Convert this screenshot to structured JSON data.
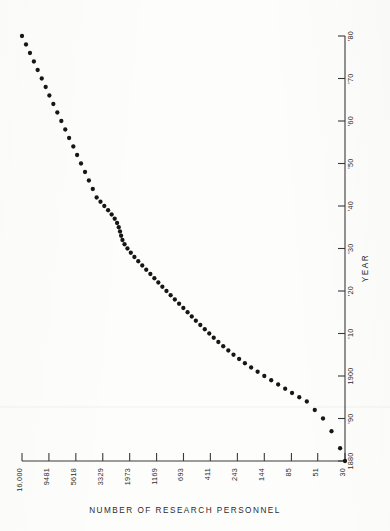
{
  "chart_data": {
    "type": "scatter",
    "title": "",
    "orientation": "transposed",
    "xlabel": "NUMBER OF RESEARCH PERSONNEL",
    "ylabel": "YEAR",
    "x_scale": "log-reversed",
    "y_scale": "linear",
    "grid": false,
    "legend": null,
    "x_tick_labels": [
      "16,000",
      "9481",
      "5618",
      "3329",
      "1973",
      "1169",
      "693",
      "411",
      "243",
      "144",
      "85",
      "51",
      "30"
    ],
    "x_tick_values": [
      16000,
      9481,
      5618,
      3329,
      1973,
      1169,
      693,
      411,
      243,
      144,
      85,
      51,
      30
    ],
    "y_tick_labels": [
      "1880",
      "'90",
      "1900",
      "'10",
      "'20",
      "'30",
      "'40",
      "'50",
      "'60",
      "'70",
      "'80"
    ],
    "y_tick_values": [
      1880,
      1890,
      1900,
      1910,
      1920,
      1930,
      1940,
      1950,
      1960,
      1970,
      1980
    ],
    "xlim": [
      16000,
      30
    ],
    "ylim": [
      1880,
      1980
    ],
    "series": [
      {
        "name": "research personnel",
        "x": [
          16000,
          14800,
          13700,
          12700,
          11800,
          10900,
          10100,
          9400,
          8700,
          8050,
          7450,
          6900,
          6400,
          5900,
          5480,
          5080,
          4700,
          4360,
          4040,
          3750,
          3480,
          3230,
          3000,
          2800,
          2640,
          2520,
          2440,
          2380,
          2330,
          2270,
          2180,
          2060,
          1930,
          1800,
          1670,
          1545,
          1430,
          1320,
          1220,
          1130,
          1045,
          965,
          890,
          820,
          755,
          695,
          640,
          590,
          545,
          500,
          458,
          420,
          385,
          352,
          320,
          290,
          262,
          235,
          210,
          186,
          164,
          144,
          126,
          110,
          96,
          84,
          73,
          63,
          54,
          46,
          39,
          33,
          30
        ],
        "y": [
          1980,
          1978,
          1976,
          1974,
          1972,
          1970,
          1968,
          1966,
          1964,
          1962,
          1960,
          1958,
          1956,
          1954,
          1952,
          1950,
          1948,
          1946,
          1944,
          1942,
          1941,
          1940,
          1939,
          1938,
          1937,
          1936,
          1935,
          1934,
          1933,
          1932,
          1931,
          1930,
          1929,
          1928,
          1927,
          1926,
          1925,
          1924,
          1923,
          1922,
          1921,
          1920,
          1919,
          1918,
          1917,
          1916,
          1915,
          1914,
          1913,
          1912,
          1911,
          1910,
          1909,
          1908,
          1907,
          1906,
          1905,
          1904,
          1903,
          1902,
          1901,
          1900,
          1899,
          1898,
          1897,
          1896,
          1895,
          1894,
          1892,
          1890,
          1887,
          1883,
          1880
        ]
      }
    ],
    "annotations": [
      {
        "text": "plateau near 1935-1941",
        "visible": false
      },
      {
        "text": "plateau near 1910-1915",
        "visible": false
      }
    ]
  },
  "axes": {
    "value_axis_caption": "NUMBER OF RESEARCH PERSONNEL",
    "year_axis_caption": "YEAR"
  }
}
